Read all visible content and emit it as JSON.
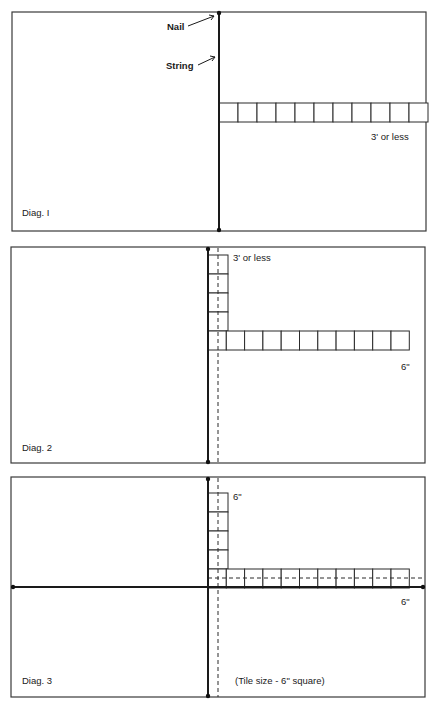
{
  "diagrams": [
    {
      "caption": "Diag. I",
      "frame": {
        "x": 12,
        "y": 12,
        "w": 414,
        "h": 219
      },
      "vertical_string": {
        "x": 219,
        "y1": 13,
        "y2": 230
      },
      "annotations": {
        "nail_label": "Nail",
        "string_label": "String",
        "measure_label": "3' or less"
      },
      "tile_row": {
        "x": 219,
        "y": 103,
        "tile": 19,
        "count": 11,
        "open_end": true
      }
    },
    {
      "caption": "Diag. 2",
      "frame": {
        "x": 11,
        "y": 247,
        "w": 414,
        "h": 216
      },
      "vertical_string": {
        "x": 208,
        "y1": 248,
        "y2": 462
      },
      "vertical_dashed": {
        "x": 218
      },
      "annotations": {
        "top_label": "3' or less",
        "right_label": "6\""
      },
      "tile_column": {
        "x": 208,
        "y": 255,
        "tile": 19,
        "count": 4
      },
      "tile_row": {
        "x": 208,
        "y": 331,
        "tile": 18.3,
        "count": 11
      }
    },
    {
      "caption": "Diag. 3",
      "frame": {
        "x": 11,
        "y": 477,
        "w": 414,
        "h": 220
      },
      "vertical_string": {
        "x": 208,
        "y1": 478,
        "y2": 696
      },
      "vertical_dashed": {
        "x": 218
      },
      "horizontal_string": {
        "y": 587,
        "x1": 13,
        "x2": 423
      },
      "horizontal_dashed": {
        "y": 578
      },
      "annotations": {
        "top_label": "6\"",
        "right_label": "6\"",
        "note": "(Tile size - 6\" square)"
      },
      "tile_column": {
        "x": 208,
        "y": 493,
        "tile": 19,
        "count": 4
      },
      "tile_row": {
        "x": 208,
        "y": 569,
        "tile": 18.3,
        "count": 11
      }
    }
  ]
}
